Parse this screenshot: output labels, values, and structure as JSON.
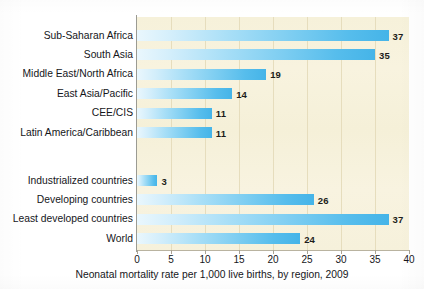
{
  "chart_data": {
    "type": "bar",
    "orientation": "horizontal",
    "title": "",
    "xlabel": "Neonatal mortality rate per 1,000 live births, by region, 2009",
    "ylabel": "",
    "xlim": [
      0,
      40
    ],
    "xticks": [
      0,
      5,
      10,
      15,
      20,
      25,
      30,
      35,
      40
    ],
    "xtick_labels": [
      "0",
      "5",
      "10",
      "15",
      "20",
      "25",
      "30",
      "35",
      "40"
    ],
    "grid": "vertical",
    "legend": "none",
    "groups": [
      {
        "name": "regions",
        "categories": [
          "Sub-Saharan Africa",
          "South Asia",
          "Middle East/North Africa",
          "East Asia/Pacific",
          "CEE/CIS",
          "Latin America/Caribbean"
        ],
        "values": [
          37,
          35,
          19,
          14,
          11,
          11
        ],
        "value_labels": [
          "37",
          "35",
          "19",
          "14",
          "11",
          "11"
        ]
      },
      {
        "name": "aggregates",
        "categories": [
          "Industrialized countries",
          "Developing countries",
          "Least developed countries",
          "World"
        ],
        "values": [
          3,
          26,
          37,
          24
        ],
        "value_labels": [
          "3",
          "26",
          "37",
          "24"
        ]
      }
    ]
  },
  "caption": {
    "text": "Neonatal mortality rate per 1,000 live births, by region, 2009"
  },
  "colors": {
    "bar_light": "#eaf7fd",
    "bar_dark": "#45b4e8",
    "plot_background": "#f7f2dc",
    "gridline": "#e6ddbd",
    "axis_line": "#9b9b93",
    "text": "#15161a",
    "page_background": "#ffffff"
  }
}
